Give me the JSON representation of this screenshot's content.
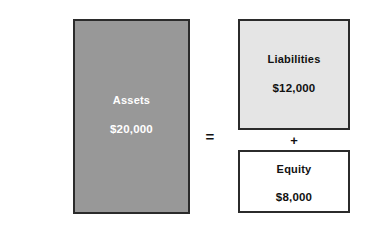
{
  "diagram": {
    "type": "accounting-equation",
    "background_color": "#ffffff",
    "boxes": [
      {
        "id": "assets",
        "label": "Assets",
        "value": "$20,000",
        "fill_color": "#989898",
        "text_color": "#ffffff",
        "border_color": "#2b2b2b"
      },
      {
        "id": "liabilities",
        "label": "Liabilities",
        "value": "$12,000",
        "fill_color": "#e5e5e5",
        "text_color": "#111111",
        "border_color": "#2b2b2b"
      },
      {
        "id": "equity",
        "label": "Equity",
        "value": "$8,000",
        "fill_color": "#ffffff",
        "text_color": "#111111",
        "border_color": "#2b2b2b"
      }
    ],
    "operators": {
      "equals": "=",
      "plus": "+"
    }
  },
  "chart_data": {
    "type": "bar",
    "title": "",
    "xlabel": "",
    "ylabel": "",
    "categories": [
      "Assets",
      "Liabilities",
      "Equity"
    ],
    "values": [
      20000,
      12000,
      8000
    ],
    "value_labels": [
      "$20,000",
      "$12,000",
      "$8,000"
    ],
    "colors": [
      "#989898",
      "#e5e5e5",
      "#ffffff"
    ],
    "relation": "Assets = Liabilities + Equity",
    "grid": false,
    "legend": "none"
  }
}
